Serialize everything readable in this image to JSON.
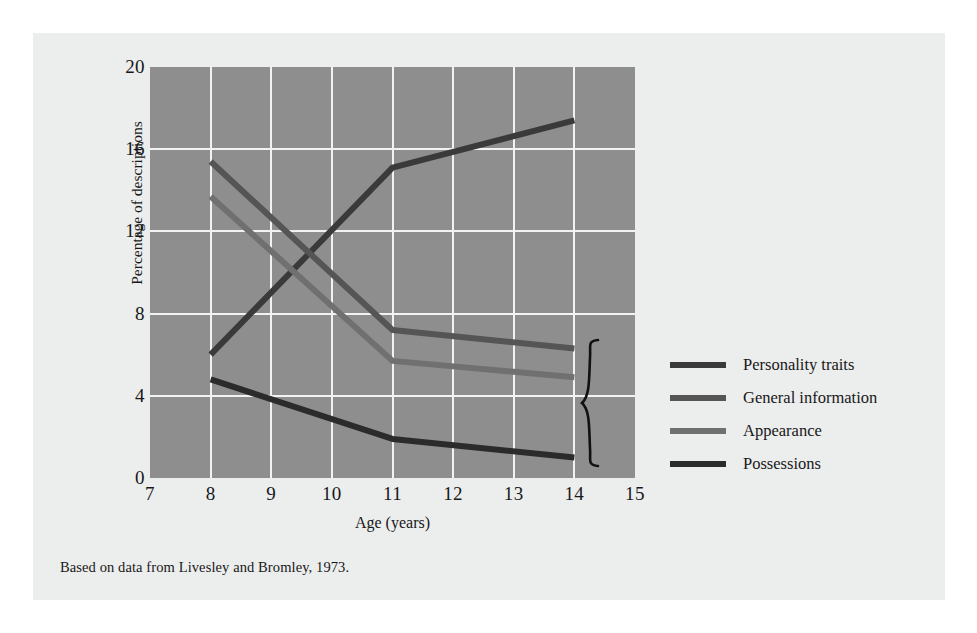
{
  "figure": {
    "caption": "Based on data from Livesley and Bromley, 1973.",
    "panel_background": "#eceded",
    "plot_background": "#8e8e8e",
    "grid_color": "#f2f2f2"
  },
  "chart_data": {
    "type": "line",
    "title": "",
    "xlabel": "Age (years)",
    "ylabel": "Percentage of descriptions including this feature",
    "ylabel_line1": "Percentage of descriptions",
    "ylabel_line2": "including this feature",
    "x": [
      8,
      11,
      14
    ],
    "xlim": [
      7,
      15
    ],
    "ylim": [
      0,
      20
    ],
    "xticks": [
      7,
      8,
      9,
      10,
      11,
      12,
      13,
      14,
      15
    ],
    "yticks": [
      0,
      4,
      8,
      12,
      16,
      20
    ],
    "grid": true,
    "legend_position": "right",
    "series": [
      {
        "name": "Personality traits",
        "color": "#3a3a3a",
        "values": [
          6.0,
          15.1,
          17.4
        ]
      },
      {
        "name": "General information",
        "color": "#555555",
        "values": [
          15.4,
          7.2,
          6.3
        ]
      },
      {
        "name": "Appearance",
        "color": "#707070",
        "values": [
          13.7,
          5.7,
          4.9
        ]
      },
      {
        "name": "Possessions",
        "color": "#2b2b2b",
        "values": [
          4.8,
          1.9,
          1.0
        ]
      }
    ],
    "annotations": [
      {
        "name": "brace",
        "shape": "curly-brace",
        "x": 14.6,
        "y_from": 1.0,
        "y_to": 7.0,
        "label": ""
      }
    ]
  },
  "legend": {
    "items": [
      {
        "label": "Personality traits",
        "color": "#3a3a3a"
      },
      {
        "label": "General information",
        "color": "#555555"
      },
      {
        "label": "Appearance",
        "color": "#707070"
      },
      {
        "label": "Possessions",
        "color": "#2b2b2b"
      }
    ]
  }
}
